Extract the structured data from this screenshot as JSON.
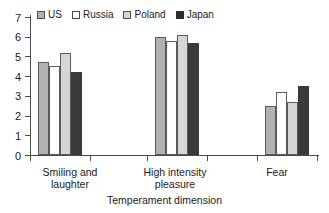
{
  "chart_data": {
    "type": "bar",
    "title": "",
    "xlabel": "Temperament dimension",
    "ylabel": "",
    "categories": [
      "Smiling and laughter",
      "High  intensity pleasure",
      "Fear"
    ],
    "category_lines": [
      [
        "Smiling and",
        "laughter"
      ],
      [
        "High  intensity",
        "pleasure"
      ],
      [
        "Fear",
        ""
      ]
    ],
    "series": [
      {
        "name": "US",
        "color": "#b2b2b2",
        "values": [
          4.7,
          6.0,
          2.5
        ]
      },
      {
        "name": "Russia",
        "color": "#ffffff",
        "values": [
          4.5,
          5.8,
          3.2
        ]
      },
      {
        "name": "Poland",
        "color": "#d6d6d6",
        "values": [
          5.2,
          6.1,
          2.7
        ]
      },
      {
        "name": "Japan",
        "color": "#3a3a3a",
        "values": [
          4.2,
          5.7,
          3.5
        ]
      }
    ],
    "ylim": [
      0,
      7
    ],
    "yticks": [
      0,
      1,
      2,
      3,
      4,
      5,
      6,
      7
    ],
    "ytick_labels": [
      "0",
      "1",
      "2",
      "3",
      "4",
      "5",
      "6",
      "7"
    ],
    "grid": false,
    "legend_position": "top-left"
  },
  "axis": {
    "y_labels": [
      "7",
      "6",
      "5",
      "4",
      "3",
      "2",
      "1",
      "0"
    ],
    "x_title": "Temperament dimension"
  },
  "legend": {
    "items": [
      {
        "label": "US"
      },
      {
        "label": "Russia"
      },
      {
        "label": "Poland"
      },
      {
        "label": "Japan"
      }
    ]
  },
  "categories": [
    {
      "line1": "Smiling and",
      "line2": "laughter"
    },
    {
      "line1": "High  intensity",
      "line2": "pleasure"
    },
    {
      "line1": "Fear",
      "line2": ""
    }
  ]
}
